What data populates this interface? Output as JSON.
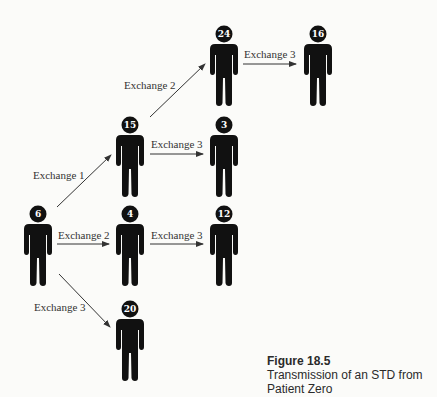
{
  "figure": {
    "number": "Figure 18.5",
    "caption": "Transmission of an STD from Patient Zero"
  },
  "colors": {
    "figure_fill": "#111111",
    "arrow": "#333333",
    "label_text": "#333333",
    "background": "#fbfbf9"
  },
  "people": [
    {
      "id": "p6",
      "label": "6",
      "x": 38,
      "y": 214,
      "role": "patient-zero"
    },
    {
      "id": "p15",
      "label": "15",
      "x": 130,
      "y": 125
    },
    {
      "id": "p24",
      "label": "24",
      "x": 224,
      "y": 34
    },
    {
      "id": "p16",
      "label": "16",
      "x": 318,
      "y": 34
    },
    {
      "id": "p3",
      "label": "3",
      "x": 224,
      "y": 125
    },
    {
      "id": "p4",
      "label": "4",
      "x": 130,
      "y": 214
    },
    {
      "id": "p12",
      "label": "12",
      "x": 224,
      "y": 214
    },
    {
      "id": "p20",
      "label": "20",
      "x": 130,
      "y": 309
    }
  ],
  "edges": [
    {
      "from": "p6",
      "to": "p15",
      "label": "Exchange 1"
    },
    {
      "from": "p15",
      "to": "p24",
      "label": "Exchange 2"
    },
    {
      "from": "p24",
      "to": "p16",
      "label": "Exchange 3"
    },
    {
      "from": "p15",
      "to": "p3",
      "label": "Exchange 3"
    },
    {
      "from": "p6",
      "to": "p4",
      "label": "Exchange 2"
    },
    {
      "from": "p4",
      "to": "p12",
      "label": "Exchange 3"
    },
    {
      "from": "p6",
      "to": "p20",
      "label": "Exchange 3"
    }
  ]
}
